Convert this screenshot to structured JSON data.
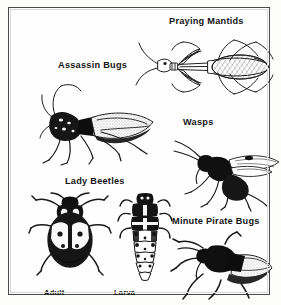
{
  "figure": {
    "background_color": "#fefefe",
    "border_color": "#4a4a4a",
    "ink_color": "#151515",
    "style": "black-and-white line art / scanned print illustration"
  },
  "labels": {
    "praying_mantids": "Praying Mantids",
    "assassin_bugs": "Assassin Bugs",
    "wasps": "Wasps",
    "lady_beetles": "Lady Beetles",
    "minute_pirate_bugs": "Minute Pirate Bugs",
    "adult": "Adult",
    "larva": "Larva"
  },
  "illustrations": [
    {
      "name": "praying-mantis-illustration",
      "label": "Praying Mantids",
      "view": "dorsal",
      "description": "Elongated mantis seen from above, head at left with raptorial forelegs folded, long hatched abdomen at right, four walking legs splayed"
    },
    {
      "name": "assassin-bug-illustration",
      "label": "Assassin Bugs",
      "view": "lateral",
      "description": "Dark-bodied true bug in side view with long curving antennae, stout beak, and a pale stippled wing over the abdomen"
    },
    {
      "name": "wasp-illustration",
      "label": "Wasps",
      "view": "lateral",
      "description": "Small parasitic wasp in side view, dark thorax and abdomen, long antennae sweeping up and left, outlined transparent wings"
    },
    {
      "name": "lady-beetle-adult-illustration",
      "label": "Adult",
      "view": "dorsal",
      "description": "Oval lady beetle from above with dark and light elytra markings and spots, six legs and short antennae"
    },
    {
      "name": "lady-beetle-larva-illustration",
      "label": "Larva",
      "view": "dorsal",
      "description": "Elongated alligator-like segmented larva tapering to the rear, dark banded segments with pale tubercles"
    },
    {
      "name": "minute-pirate-bug-illustration",
      "label": "Minute Pirate Bugs",
      "view": "lateral",
      "description": "Small dark oval bug in three-quarter view with pale wing tips, legs extended forward and a short beak"
    }
  ]
}
